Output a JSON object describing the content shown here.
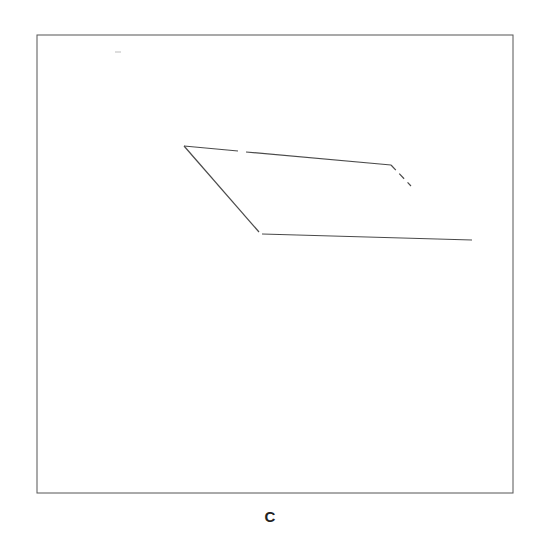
{
  "figure": {
    "caption": "C",
    "frame": {
      "x1": 37,
      "y1": 35,
      "x2": 513,
      "y2": 493,
      "color": "#555555"
    },
    "stroke_color": "#4a4a4a",
    "segments": [
      {
        "id": "top-edge-left",
        "x1": 184,
        "y1": 146,
        "x2": 238,
        "y2": 151,
        "style": "solid"
      },
      {
        "id": "top-edge-right",
        "x1": 246,
        "y1": 152,
        "x2": 391,
        "y2": 165,
        "style": "solid"
      },
      {
        "id": "right-tail",
        "x1": 391,
        "y1": 165,
        "x2": 411,
        "y2": 186,
        "style": "dashed"
      },
      {
        "id": "left-diagonal",
        "x1": 184,
        "y1": 146,
        "x2": 259,
        "y2": 232,
        "style": "solid"
      },
      {
        "id": "bottom-edge",
        "x1": 262,
        "y1": 234,
        "x2": 472,
        "y2": 240,
        "style": "solid"
      }
    ],
    "stray_mark": {
      "x1": 115,
      "y1": 52,
      "x2": 121,
      "y2": 52
    }
  }
}
